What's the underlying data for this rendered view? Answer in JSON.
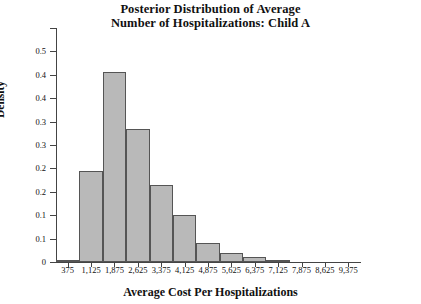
{
  "chart_data": {
    "type": "bar",
    "title": "Posterior Distribution of Average Number of Hospitalizations: Child A",
    "title_line1": "Posterior Distribution of Average",
    "title_line2": "Number of Hospitalizations: Child A",
    "xlabel": "Average Cost Per Hospitalizations",
    "ylabel": "Density",
    "grid": false,
    "legend": "none",
    "xlim": [
      0,
      9750
    ],
    "ylim": [
      0,
      0.5
    ],
    "bin_width": 750,
    "categories": [
      "375",
      "1,125",
      "1,875",
      "2,625",
      "3,375",
      "4,125",
      "4,875",
      "5,625",
      "6,375",
      "7,125",
      "7,875",
      "8,625",
      "9,375"
    ],
    "bin_centers": [
      375,
      1125,
      1875,
      2625,
      3375,
      4125,
      4875,
      5625,
      6375,
      7125,
      7875,
      8625,
      9375
    ],
    "values": [
      0.005,
      0.195,
      0.405,
      0.285,
      0.165,
      0.1,
      0.04,
      0.02,
      0.01,
      0.005,
      0,
      0,
      0
    ],
    "xticks": [
      "375",
      "1,125",
      "1,875",
      "2,625",
      "3,375",
      "4,125",
      "4,875",
      "5,625",
      "6,375",
      "7,125",
      "7,875",
      "8,625",
      "9,375"
    ],
    "xtick_values": [
      375,
      1125,
      1875,
      2625,
      3375,
      4125,
      4875,
      5625,
      6375,
      7125,
      7875,
      8625,
      9375
    ],
    "yticks": [
      "0",
      "0.1",
      "0.1",
      "0.2",
      "0.2",
      "0.3",
      "0.3",
      "0.4",
      "0.4",
      "0.5"
    ],
    "ytick_values": [
      0,
      0.05,
      0.1,
      0.15,
      0.2,
      0.25,
      0.3,
      0.35,
      0.4,
      0.45,
      0.5
    ],
    "ytick_labels": [
      "0",
      "0.1",
      "0.1",
      "0.2",
      "0.2",
      "0.3",
      "0.3",
      "0.4",
      "0.4",
      "0.5"
    ],
    "bar_fill_color": "#b9b9b9",
    "bar_edge_color": "#555555",
    "background_color": "#ffffff",
    "axis_color": "#444444"
  }
}
